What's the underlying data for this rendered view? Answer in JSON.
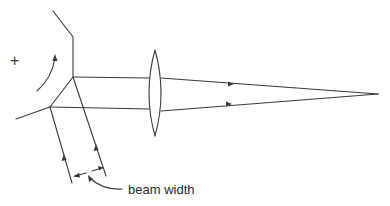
{
  "diagram": {
    "title": "",
    "labels": {
      "beam_width": "beam width",
      "rotation_sign": "+"
    },
    "elements": {
      "mirror": "rotating polygon mirror facet",
      "rotation_arrow": "curved arrow indicating mirror rotation",
      "incident_beams": "two parallel incoming beams with upward arrows",
      "reflected_beams": "two parallel beams traveling right to lens",
      "lens": "biconvex focusing lens",
      "focused_beams": "converging beams with arrows to focal point",
      "dimension": "beam width dimension arrows with curved leader"
    },
    "colors": {
      "stroke": "#3a3a3a",
      "background": "#ffffff"
    }
  }
}
